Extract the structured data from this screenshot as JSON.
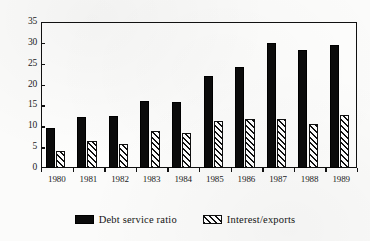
{
  "chart_data": {
    "type": "bar",
    "title": "",
    "subtitle": "",
    "xlabel": "",
    "ylabel": "",
    "categories": [
      "1980",
      "1981",
      "1982",
      "1983",
      "1984",
      "1985",
      "1986",
      "1987",
      "1988",
      "1989"
    ],
    "series": [
      {
        "name": "Debt service ratio",
        "fill": "solid-black",
        "color": "#0b0b0b",
        "values": [
          9.5,
          12.3,
          12.4,
          16.0,
          15.8,
          22.0,
          24.2,
          30.0,
          28.3,
          29.6
        ]
      },
      {
        "name": "Interest/exports",
        "fill": "diagonal-hatch",
        "color": "#ffffff",
        "values": [
          4.1,
          6.4,
          5.8,
          8.8,
          8.3,
          11.3,
          11.8,
          11.7,
          10.6,
          12.6
        ]
      }
    ],
    "yticks": [
      0,
      5,
      10,
      15,
      20,
      25,
      30,
      35
    ],
    "ylim": [
      0,
      35
    ],
    "grid": false,
    "legend_position": "bottom-center"
  },
  "legend": {
    "items": [
      {
        "label": "Debt service ratio"
      },
      {
        "label": "Interest/exports"
      }
    ]
  }
}
